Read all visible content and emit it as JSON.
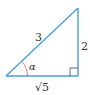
{
  "diagram": {
    "type": "right-triangle",
    "colors": {
      "edge": "#4a9fd4",
      "angle_arc": "#e07070",
      "right_angle_marker": "#555555",
      "text": "#333333"
    },
    "vertices": {
      "left": [
        6,
        76
      ],
      "right": [
        78,
        76
      ],
      "top": [
        78,
        8
      ]
    },
    "labels": {
      "hypotenuse": "3",
      "opposite": "2",
      "adjacent": "√5",
      "angle": "α"
    }
  }
}
